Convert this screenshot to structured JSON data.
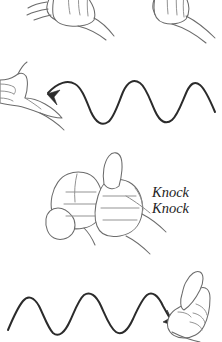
{
  "figure": {
    "background_color": "#ffffff",
    "width": 222,
    "height": 342,
    "line_color_hands": "#6b6b6b",
    "line_color_waves": "#2b2b2b",
    "text_color": "#1d1d1d"
  },
  "caption": {
    "line1": "Knock",
    "line2": "Knock"
  },
  "panels": [
    {
      "id": "panel-top",
      "name": "two-hands-cropped",
      "description": "Two fists cropped by the top edge, wrists extending to the right"
    },
    {
      "id": "panel-wave-in",
      "name": "incoming-signal-wave",
      "description": "Sine wave arrow travelling leftward into a thumbs-up hand",
      "wave_peaks": 3,
      "wave_direction": "left"
    },
    {
      "id": "panel-bump",
      "name": "fist-bump",
      "description": "Two fists touching knuckle to knuckle, right hand thumb up"
    },
    {
      "id": "panel-wave-out",
      "name": "outgoing-signal-wave",
      "description": "Sine wave arrow travelling rightward into a thumbs-up hand",
      "wave_peaks": 3,
      "wave_direction": "right"
    }
  ]
}
